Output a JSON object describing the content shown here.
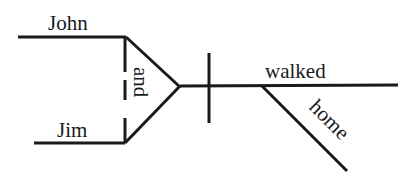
{
  "diagram": {
    "type": "sentence-diagram (Reed-Kellogg)",
    "sentence_words": {
      "subject_1": "John",
      "subject_2": "Jim",
      "conjunction": "and",
      "verb": "walked",
      "modifier": "home"
    },
    "colors": {
      "ink": "#1a1a1a",
      "background": "#ffffff"
    }
  }
}
